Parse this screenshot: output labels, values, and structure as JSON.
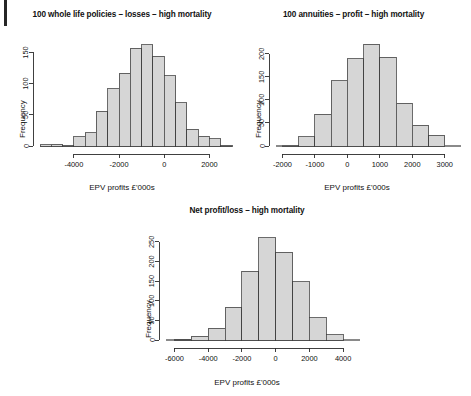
{
  "page": {
    "background_color": "#ffffff",
    "bar_fill_color": "#d6d6d6",
    "bar_stroke_color": "#3a3a3a",
    "text_color": "#111111"
  },
  "panels": [
    {
      "id": "whole-life",
      "title": "100 whole life policies – losses – high mortality",
      "xlabel": "EPV profits £'000s",
      "ylabel": "Frequency"
    },
    {
      "id": "annuities",
      "title": "100 annuities – profit – high mortality",
      "xlabel": "EPV profits £'000s",
      "ylabel": "Frequency"
    },
    {
      "id": "net",
      "title": "Net profit/loss – high mortality",
      "xlabel": "EPV profits £'000s",
      "ylabel": "Frequency"
    }
  ],
  "chart_data": [
    {
      "type": "bar",
      "id": "whole-life",
      "title": "100 whole life policies – losses – high mortality",
      "xlabel": "EPV profits £'000s",
      "ylabel": "Frequency",
      "xlim": [
        -5500,
        3000
      ],
      "ylim": [
        0,
        170
      ],
      "xticks": [
        -4000,
        -2000,
        0,
        2000
      ],
      "xtick_labels": [
        "-4000",
        "-2000",
        "0",
        "2000"
      ],
      "yticks": [
        0,
        50,
        100,
        150
      ],
      "ytick_labels": [
        "0",
        "50",
        "100",
        "150"
      ],
      "grid": false,
      "legend": "none",
      "bin_width": 500,
      "bin_edges": [
        -5500,
        -5000,
        -4500,
        -4000,
        -3500,
        -3000,
        -2500,
        -2000,
        -1500,
        -1000,
        -500,
        0,
        500,
        1000,
        1500,
        2000,
        2500,
        3000
      ],
      "categories": [
        "-5500..-5000",
        "-5000..-4500",
        "-4500..-4000",
        "-4000..-3500",
        "-3500..-3000",
        "-3000..-2500",
        "-2500..-2000",
        "-2000..-1500",
        "-1500..-1000",
        "-1000..-500",
        "-500..0",
        "0..500",
        "500..1000",
        "1000..1500",
        "1500..2000",
        "2000..2500",
        "2500..3000"
      ],
      "values": [
        2,
        3,
        1,
        15,
        21,
        56,
        92,
        117,
        157,
        162,
        144,
        113,
        69,
        27,
        16,
        12,
        1
      ]
    },
    {
      "type": "bar",
      "id": "annuities",
      "title": "100 annuities – profit – high mortality",
      "xlabel": "EPV profits £'000s",
      "ylabel": "Frequency",
      "xlim": [
        -2200,
        3500
      ],
      "ylim": [
        0,
        230
      ],
      "xticks": [
        -2000,
        -1000,
        0,
        1000,
        2000,
        3000
      ],
      "xtick_labels": [
        "-2000",
        "-1000",
        "0",
        "1000",
        "2000",
        "3000"
      ],
      "yticks": [
        0,
        50,
        100,
        150,
        200
      ],
      "ytick_labels": [
        "0",
        "50",
        "100",
        "150",
        "200"
      ],
      "grid": false,
      "legend": "none",
      "bin_width": 500,
      "bin_edges": [
        -2000,
        -1500,
        -1000,
        -500,
        0,
        500,
        1000,
        1500,
        2000,
        2500,
        3000
      ],
      "categories": [
        "-2000..-1500",
        "-1500..-1000",
        "-1000..-500",
        "-500..0",
        "0..500",
        "500..1000",
        "1000..1500",
        "1500..2000",
        "2000..2500",
        "2500..3000"
      ],
      "values": [
        2,
        20,
        69,
        142,
        189,
        221,
        193,
        93,
        45,
        23
      ]
    },
    {
      "type": "bar",
      "id": "net",
      "title": "Net profit/loss – high mortality",
      "xlabel": "EPV profits £'000s",
      "ylabel": "Frequency",
      "xlim": [
        -6500,
        5000
      ],
      "ylim": [
        0,
        270
      ],
      "xticks": [
        -6000,
        -4000,
        -2000,
        0,
        2000,
        4000
      ],
      "xtick_labels": [
        "-6000",
        "-4000",
        "-2000",
        "0",
        "2000",
        "4000"
      ],
      "yticks": [
        0,
        50,
        100,
        150,
        200,
        250
      ],
      "ytick_labels": [
        "0",
        "50",
        "100",
        "150",
        "200",
        "250"
      ],
      "grid": false,
      "legend": "none",
      "bin_width": 1000,
      "bin_edges": [
        -6000,
        -5000,
        -4000,
        -3000,
        -2000,
        -1000,
        0,
        1000,
        2000,
        3000,
        4000
      ],
      "categories": [
        "-6000..-5000",
        "-5000..-4000",
        "-4000..-3000",
        "-3000..-2000",
        "-2000..-1000",
        "-1000..0",
        "0..1000",
        "1000..2000",
        "2000..3000",
        "3000..4000"
      ],
      "values": [
        1,
        10,
        30,
        84,
        175,
        261,
        224,
        148,
        57,
        14
      ]
    }
  ]
}
